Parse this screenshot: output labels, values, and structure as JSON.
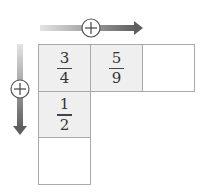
{
  "title": "",
  "arrows": {
    "horizontal": {
      "symbol": "+",
      "direction": "right"
    },
    "vertical": {
      "symbol": "+",
      "direction": "down"
    }
  },
  "grid": {
    "cells": [
      {
        "row": 0,
        "col": 0,
        "numerator": "3",
        "denominator": "4",
        "filled": true
      },
      {
        "row": 0,
        "col": 1,
        "numerator": "5",
        "denominator": "9",
        "filled": true
      },
      {
        "row": 0,
        "col": 2,
        "numerator": "",
        "denominator": "",
        "filled": false
      },
      {
        "row": 1,
        "col": 0,
        "numerator": "1",
        "denominator": "2",
        "filled": true
      },
      {
        "row": 2,
        "col": 0,
        "numerator": "",
        "denominator": "",
        "filled": false
      }
    ]
  },
  "colors": {
    "border": "#a9a9a9",
    "filled": "#efefef",
    "arrow_dark": "#666666",
    "arrow_light": "#d8d8d8"
  }
}
